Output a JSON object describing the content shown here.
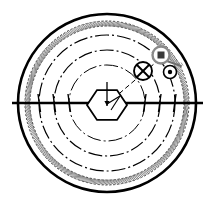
{
  "canvas": {
    "width": 215,
    "height": 206,
    "background": "#ffffff",
    "ink": "#000000",
    "ink_light": "#6b6b6b",
    "ink_mid": "#9a9a9a"
  },
  "figure": {
    "kind": "engineering-line-drawing",
    "center": {
      "x": 107,
      "y": 103
    }
  },
  "rings": [
    {
      "name": "outer-rim",
      "radius": 89,
      "stroke": "#000000",
      "stroke_width": 2.6,
      "style": "solid"
    },
    {
      "name": "hatched-band-outer",
      "radius": 82,
      "stroke": "#555555",
      "stroke_width": 1.0,
      "style": "fine-dashed"
    },
    {
      "name": "hatched-band-inner",
      "radius": 77,
      "stroke": "#555555",
      "stroke_width": 1.0,
      "style": "fine-dashed"
    },
    {
      "name": "ring-chain-1",
      "radius": 68,
      "stroke": "#000000",
      "stroke_width": 1.2,
      "style": "chain-dash-dot"
    },
    {
      "name": "ring-chain-2",
      "radius": 53,
      "stroke": "#000000",
      "stroke_width": 1.2,
      "style": "chain-dash-dot"
    },
    {
      "name": "ring-chain-3",
      "radius": 38,
      "stroke": "#000000",
      "stroke_width": 1.0,
      "style": "chain-dash-dot"
    }
  ],
  "centerline": {
    "name": "horizontal-centerline",
    "x1": 12,
    "x2": 203,
    "y": 103,
    "stroke": "#000000",
    "stroke_width": 2.4
  },
  "hub": {
    "name": "hexagon-hub",
    "cx": 107,
    "cy": 105,
    "radius": 20,
    "stroke": "#000000",
    "stroke_width": 1.8,
    "fill": "#ffffff"
  },
  "hub_arrow": {
    "name": "vertical-arrow",
    "x": 107,
    "y_top": 82,
    "y_bottom": 106,
    "stroke": "#000000",
    "stroke_width": 1.3
  },
  "radial_line": {
    "name": "radial-leader",
    "from": {
      "x": 107,
      "y": 104
    },
    "to": {
      "x": 168,
      "y": 52
    },
    "stroke": "#000000",
    "stroke_width": 1.0,
    "style": "dashed"
  },
  "markers": [
    {
      "id": "marker-crossed-circle",
      "name": "crossed-circle-marker",
      "symbol": "circle-with-x",
      "cx": 143,
      "cy": 71,
      "radius": 9,
      "stroke": "#000000",
      "stroke_width": 1.9,
      "fill": "#ffffff"
    },
    {
      "id": "marker-square-in-circle",
      "name": "square-in-circle-marker",
      "symbol": "circle-with-square",
      "cx": 161,
      "cy": 55,
      "radius": 8.5,
      "stroke": "#8a8a8a",
      "stroke_width": 2.4,
      "fill": "#ffffff",
      "inner_size": 7,
      "inner_fill": "#3a3a3a"
    },
    {
      "id": "marker-dot-circle",
      "name": "dot-in-circle-marker",
      "symbol": "circle-with-dot",
      "cx": 170,
      "cy": 72,
      "radius": 6.5,
      "stroke": "#000000",
      "stroke_width": 1.6,
      "fill": "#ffffff",
      "dot_radius": 2.2,
      "dot_fill": "#000000"
    }
  ],
  "pointer": {
    "name": "angled-pointer-arm",
    "from": {
      "x": 164,
      "y": 60
    },
    "to": {
      "x": 181,
      "y": 66
    },
    "stroke": "#6e6e6e",
    "stroke_width": 2.0,
    "hatch_stroke": "#8a8a8a"
  },
  "spokes": {
    "name": "centerline-tick-marks",
    "stroke": "#000000",
    "stroke_width": 1.4,
    "positions": [
      38,
      53,
      68,
      146,
      161,
      176
    ]
  }
}
